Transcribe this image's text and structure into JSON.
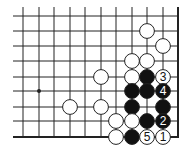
{
  "board": {
    "description": "Go problem diagram, lower-right corner",
    "columns_x": [
      23,
      39,
      54,
      70,
      85,
      101,
      116,
      132,
      147,
      163
    ],
    "rows_y": [
      16,
      31,
      46,
      61,
      77,
      91,
      107,
      121
    ],
    "right_edge_x": 178,
    "bottom_edge_y": 137,
    "line_left_x": 13,
    "line_top_y": 7,
    "stone_radius": 7.4,
    "colors": {
      "line": "#222222",
      "black": "#111111",
      "white": "#ffffff",
      "background": "#ffffff"
    },
    "star_points": [
      {
        "x": 39,
        "y": 91
      }
    ],
    "stones": [
      {
        "color": "white",
        "x": 147,
        "y": 31,
        "label": ""
      },
      {
        "color": "white",
        "x": 163,
        "y": 46,
        "label": ""
      },
      {
        "color": "white",
        "x": 132,
        "y": 61,
        "label": ""
      },
      {
        "color": "white",
        "x": 147,
        "y": 61,
        "label": ""
      },
      {
        "color": "white",
        "x": 101,
        "y": 77,
        "label": ""
      },
      {
        "color": "white",
        "x": 132,
        "y": 77,
        "label": ""
      },
      {
        "color": "black",
        "x": 147,
        "y": 77,
        "label": ""
      },
      {
        "color": "white",
        "x": 163,
        "y": 77,
        "label": "3"
      },
      {
        "color": "black",
        "x": 132,
        "y": 91,
        "label": ""
      },
      {
        "color": "black",
        "x": 147,
        "y": 91,
        "label": ""
      },
      {
        "color": "black",
        "x": 163,
        "y": 91,
        "label": "4"
      },
      {
        "color": "white",
        "x": 70,
        "y": 107,
        "label": ""
      },
      {
        "color": "white",
        "x": 101,
        "y": 107,
        "label": ""
      },
      {
        "color": "black",
        "x": 132,
        "y": 107,
        "label": ""
      },
      {
        "color": "black",
        "x": 163,
        "y": 107,
        "label": ""
      },
      {
        "color": "white",
        "x": 116,
        "y": 121,
        "label": ""
      },
      {
        "color": "white",
        "x": 132,
        "y": 121,
        "label": ""
      },
      {
        "color": "black",
        "x": 147,
        "y": 121,
        "label": ""
      },
      {
        "color": "black",
        "x": 163,
        "y": 121,
        "label": "2"
      },
      {
        "color": "white",
        "x": 116,
        "y": 137,
        "label": ""
      },
      {
        "color": "black",
        "x": 132,
        "y": 137,
        "label": ""
      },
      {
        "color": "white",
        "x": 147,
        "y": 137,
        "label": "5"
      },
      {
        "color": "white",
        "x": 163,
        "y": 137,
        "label": "1"
      }
    ]
  }
}
